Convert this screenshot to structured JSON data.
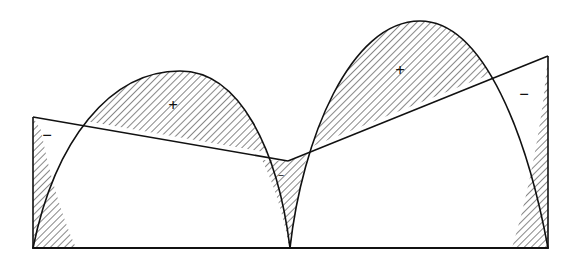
{
  "figure": {
    "canvas": {
      "width": 572,
      "height": 266,
      "background": "#ffffff"
    },
    "style": {
      "stroke_color": "#111111",
      "hatch_color": "#111111",
      "stroke_width_curve": 1.6,
      "stroke_width_baseline": 1.8,
      "hatch_angle_deg": 45,
      "hatch_spacing_px": 5
    },
    "geometry": {
      "baseline": {
        "y": 248,
        "x_start": 33,
        "x_end": 548
      },
      "left_arch": {
        "start": {
          "x": 33,
          "y": 248
        },
        "apex": {
          "x": 180,
          "y": 71
        },
        "end": {
          "x": 290,
          "y": 248
        }
      },
      "right_arch": {
        "start": {
          "x": 290,
          "y": 248
        },
        "apex": {
          "x": 420,
          "y": 21
        },
        "end": {
          "x": 548,
          "y": 248
        }
      },
      "chord_left": {
        "from": {
          "x": 33,
          "y": 117
        },
        "to": {
          "x": 288,
          "y": 161
        }
      },
      "chord_right": {
        "from": {
          "x": 288,
          "y": 161
        },
        "to": {
          "x": 548,
          "y": 56
        }
      },
      "left_vertical_edge": {
        "x": 33,
        "y_top": 117,
        "y_bottom": 248
      },
      "right_vertical_edge": {
        "x": 548,
        "y_top": 56,
        "y_bottom": 248
      }
    },
    "regions": [
      {
        "id": "left-negative-wedge",
        "sign": "−",
        "label_x": 47,
        "label_y": 137,
        "label_size": "normal",
        "hatched": true,
        "note": "Region left of the left arch, below the left chord, above the baseline."
      },
      {
        "id": "left-positive-lune",
        "sign": "+",
        "label_x": 173,
        "label_y": 107,
        "label_size": "normal",
        "hatched": true,
        "note": "Region between the left arch above and the left chord below."
      },
      {
        "id": "center-negative-cusp",
        "sign": "−",
        "label_x": 281,
        "label_y": 176,
        "label_size": "small",
        "hatched": true,
        "note": "Narrow cusp between the two arches, below the chord intersection, reaching the baseline."
      },
      {
        "id": "right-positive-lune",
        "sign": "+",
        "label_x": 400,
        "label_y": 72,
        "label_size": "normal",
        "hatched": true,
        "note": "Region between the right arch above and the right chord below."
      },
      {
        "id": "right-negative-wedge",
        "sign": "−",
        "label_x": 524,
        "label_y": 96,
        "label_size": "normal",
        "hatched": true,
        "note": "Region right of the right arch, above the right chord, left of the right vertical edge."
      }
    ]
  }
}
